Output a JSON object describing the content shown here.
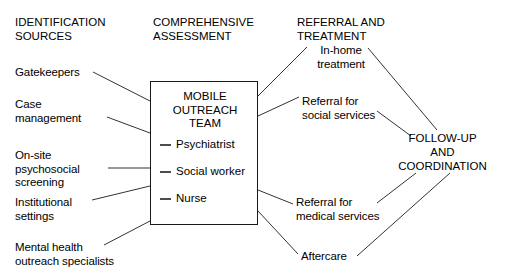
{
  "diagram": {
    "columns": [
      {
        "id": "identification",
        "heading": "IDENTIFICATION\nSOURCES"
      },
      {
        "id": "assessment",
        "heading": "COMPREHENSIVE\nASSESSMENT"
      },
      {
        "id": "referral",
        "heading": "REFERRAL AND\nTREATMENT"
      }
    ],
    "sources": [
      {
        "id": "gatekeepers",
        "label": "Gatekeepers"
      },
      {
        "id": "case-management",
        "label": "Case\nmanagement"
      },
      {
        "id": "on-site-psychosocial-screening",
        "label": "On-site\npsychosocial\nscreening"
      },
      {
        "id": "institutional-settings",
        "label": "Institutional\nsettings"
      },
      {
        "id": "mental-health-outreach-specialists",
        "label": "Mental health\noutreach specialists"
      }
    ],
    "team_box": {
      "title": "MOBILE\nOUTREACH\nTEAM",
      "members": [
        {
          "id": "psychiatrist",
          "label": "Psychiatrist"
        },
        {
          "id": "social-worker",
          "label": "Social worker"
        },
        {
          "id": "nurse",
          "label": "Nurse"
        }
      ]
    },
    "outcomes": [
      {
        "id": "in-home-treatment",
        "label": "In-home\ntreatment"
      },
      {
        "id": "referral-social-services",
        "label": "Referral for\nsocial services"
      },
      {
        "id": "referral-medical-services",
        "label": "Referral for\nmedical services"
      },
      {
        "id": "aftercare",
        "label": "Aftercare"
      }
    ],
    "hub": {
      "id": "follow-up-coordination",
      "label": "FOLLOW-UP\nAND\nCOORDINATION"
    },
    "colors": {
      "line": "#333333",
      "text": "#000000",
      "background": "#ffffff",
      "member_dash": "#4d4d4d"
    }
  }
}
